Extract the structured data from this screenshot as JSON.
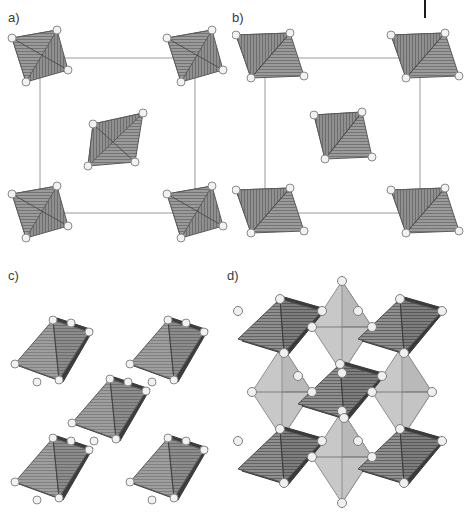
{
  "figure": {
    "width": 464,
    "height": 528,
    "background": "#ffffff",
    "top_artifact_note": "clipped black vertical rule at top-right",
    "ghost_text": ""
  },
  "palette": {
    "outline": "#555555",
    "cell_line": "#9a9a9a",
    "vertex_fill": "#f2f2f2",
    "vertex_stroke": "#8a8a8a",
    "face_mid_gray": "#969696",
    "face_dark_gray": "#6e6e6e",
    "face_light_gray": "#c8c8c8",
    "face_edge_dark": "#3c3c3c",
    "hatch_line": "#737373",
    "label_color": "#3a3a3a"
  },
  "panels": [
    {
      "id": "a",
      "label": "a)",
      "label_x": 8,
      "label_y": 10,
      "content": "tetrahedra-unit-cell",
      "description": "Unit cell outline with tetrahedra at four corners and one at the body center",
      "cell": {
        "x": 40,
        "y": 58,
        "w": 155,
        "h": 155
      },
      "polyhedron_type": "tetrahedron",
      "polyhedron_count": 5,
      "shading": "mid-gray hatched",
      "units": [
        {
          "cx": 40,
          "cy": 58,
          "rot": 0
        },
        {
          "cx": 195,
          "cy": 58,
          "rot": 0
        },
        {
          "cx": 40,
          "cy": 213,
          "rot": 0
        },
        {
          "cx": 195,
          "cy": 213,
          "rot": 0
        },
        {
          "cx": 117,
          "cy": 135,
          "rot": 0
        }
      ]
    },
    {
      "id": "b",
      "label": "b)",
      "label_x": 232,
      "label_y": 10,
      "content": "tetrahedra-unit-cell-rotated",
      "description": "Unit cell outline with rotated (flattened) tetrahedra at four corners and one at the body center",
      "cell": {
        "x": 265,
        "y": 58,
        "w": 155,
        "h": 155
      },
      "polyhedron_type": "tetrahedron",
      "polyhedron_count": 5,
      "shading": "mid-gray hatched",
      "units": [
        {
          "cx": 265,
          "cy": 58,
          "rot": 0
        },
        {
          "cx": 420,
          "cy": 58,
          "rot": 0
        },
        {
          "cx": 265,
          "cy": 213,
          "rot": 0
        },
        {
          "cx": 420,
          "cy": 213,
          "rot": 0
        },
        {
          "cx": 342,
          "cy": 135,
          "rot": 0
        }
      ]
    },
    {
      "id": "c",
      "label": "c)",
      "label_x": 8,
      "label_y": 268,
      "content": "isolated-octahedra",
      "description": "Five isolated octahedra in a quincunx arrangement, no unit cell lines",
      "polyhedron_type": "octahedron",
      "polyhedron_count": 5,
      "shading": "mid-gray hatched with dark edge bands",
      "units": [
        {
          "cx": 57,
          "cy": 352
        },
        {
          "cx": 172,
          "cy": 352
        },
        {
          "cx": 114,
          "cy": 411
        },
        {
          "cx": 57,
          "cy": 470
        },
        {
          "cx": 172,
          "cy": 470
        }
      ]
    },
    {
      "id": "d",
      "label": "d)",
      "label_x": 227,
      "label_y": 268,
      "content": "corner-sharing-octahedral-network",
      "description": "Corner-sharing octahedra forming a perovskite-like network, alternating dark hatched and light plain octahedra",
      "polyhedron_type": "octahedron",
      "polyhedron_count": 13,
      "shading": "alternating dark-gray hatched and light-gray plain",
      "dark_units": [
        {
          "cx": 282,
          "cy": 327
        },
        {
          "cx": 402,
          "cy": 327
        },
        {
          "cx": 342,
          "cy": 392
        },
        {
          "cx": 282,
          "cy": 457
        },
        {
          "cx": 402,
          "cy": 457
        }
      ],
      "light_units": [
        {
          "cx": 342,
          "cy": 327
        },
        {
          "cx": 282,
          "cy": 392
        },
        {
          "cx": 402,
          "cy": 392
        },
        {
          "cx": 342,
          "cy": 457
        }
      ]
    }
  ]
}
